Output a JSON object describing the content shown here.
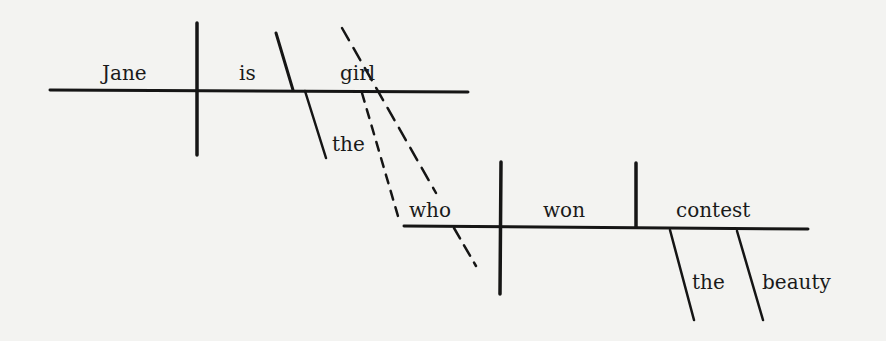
{
  "diagram": {
    "type": "sentence-diagram",
    "sentence": "Jane is the girl who won the beauty contest",
    "main_clause": {
      "subject": "Jane",
      "verb": "is",
      "predicate_nominative": "girl",
      "modifier": "the"
    },
    "relative_clause": {
      "subject": "who",
      "verb": "won",
      "object": "contest",
      "modifiers": [
        "the",
        "beauty"
      ]
    },
    "colors": {
      "ink": "#151515",
      "paper": "#f3f3f1"
    }
  }
}
